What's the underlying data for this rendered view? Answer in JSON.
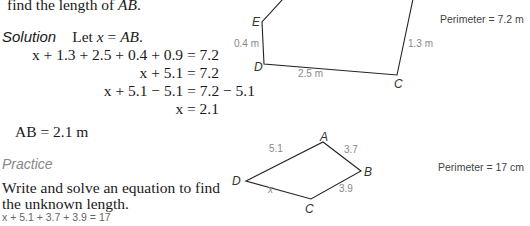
{
  "problem": {
    "intro_line": "find the length of ",
    "intro_var": "AB",
    "intro_end": "."
  },
  "solution": {
    "heading": "Solution",
    "let_text": "Let ",
    "let_var": "x",
    "let_eq": " = ",
    "let_target": "AB",
    "let_end": ".",
    "steps": [
      "x + 1.3 + 2.5 + 0.4 + 0.9 = 7.2",
      "x + 5.1 = 7.2",
      "x + 5.1 − 5.1 = 7.2 − 5.1",
      "x = 2.1"
    ],
    "answer": "AB = 2.1 m"
  },
  "figure1": {
    "vertices": {
      "E": "E",
      "D": "D",
      "C": "C"
    },
    "edge_labels": {
      "ED": "0.4 m",
      "DC": "2.5 m",
      "C_right": "1.3 m"
    },
    "perimeter": "Perimeter = 7.2 m"
  },
  "practice": {
    "heading": "Practice",
    "instruction_line1": "Write and solve an equation to find",
    "instruction_line2": "the unknown length.",
    "written_answer": "x + 5.1 + 3.7 + 3.9 = 17"
  },
  "figure2": {
    "vertices": {
      "A": "A",
      "B": "B",
      "C": "C",
      "D": "D"
    },
    "edge_labels": {
      "DA": "5.1",
      "AB": "3.7",
      "BC": "3.9",
      "DC": "x"
    },
    "perimeter": "Perimeter = 17 cm"
  }
}
